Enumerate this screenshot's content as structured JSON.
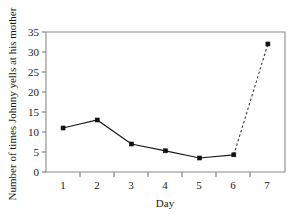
{
  "chart_data": {
    "type": "line",
    "title": "",
    "xlabel": "Day",
    "ylabel": "Number of times Johnny yells at his mother",
    "x": [
      1,
      2,
      3,
      4,
      5,
      6,
      7
    ],
    "categories": [
      "1",
      "2",
      "3",
      "4",
      "5",
      "6",
      "7"
    ],
    "values": [
      11,
      13,
      7,
      5.3,
      3.5,
      4.3,
      32
    ],
    "series": [
      {
        "name": "Observed",
        "style": "solid",
        "x": [
          1,
          2,
          3,
          4,
          5,
          6
        ],
        "values": [
          11,
          13,
          7,
          5.3,
          3.5,
          4.3
        ]
      },
      {
        "name": "Projected",
        "style": "dashed",
        "x": [
          6,
          7
        ],
        "values": [
          4.3,
          32
        ]
      }
    ],
    "xlim": [
      0.5,
      7.5
    ],
    "ylim": [
      0,
      35
    ],
    "ytick_labels": [
      "0",
      "5",
      "10",
      "15",
      "20",
      "25",
      "30",
      "35"
    ],
    "yticks": [
      0,
      5,
      10,
      15,
      20,
      25,
      30,
      35
    ],
    "xtick_labels": [
      "1",
      "2",
      "3",
      "4",
      "5",
      "6",
      "7"
    ],
    "xticks": [
      1,
      2,
      3,
      4,
      5,
      6,
      7
    ],
    "grid": false,
    "legend": "none",
    "marker": "square",
    "line_color": "#1a1a1a",
    "frame_color": "#8a8a8a",
    "background": "#ffffff"
  },
  "labels": {
    "y_axis_title": "Number of times Johnny yells at his mother",
    "x_axis_title": "Day",
    "y_tick_0": "0",
    "y_tick_5": "5",
    "y_tick_10": "10",
    "y_tick_15": "15",
    "y_tick_20": "20",
    "y_tick_25": "25",
    "y_tick_30": "30",
    "y_tick_35": "35",
    "x_tick_1": "1",
    "x_tick_2": "2",
    "x_tick_3": "3",
    "x_tick_4": "4",
    "x_tick_5": "5",
    "x_tick_6": "6",
    "x_tick_7": "7"
  }
}
